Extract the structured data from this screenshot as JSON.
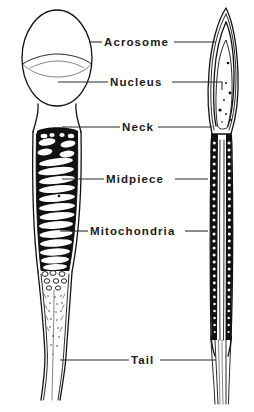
{
  "figure": {
    "background_color": "#ffffff",
    "ink_color": "#111111",
    "label_color": "#1a1a1a",
    "views": [
      {
        "name": "flat-face-view",
        "position": "left"
      },
      {
        "name": "edge-side-view",
        "position": "right"
      }
    ]
  },
  "labels": [
    {
      "id": "acrosome",
      "text": "Acrosome",
      "text_x": 104,
      "text_y": 46,
      "left_leader": {
        "x1": 90,
        "y1": 42,
        "x2": 102,
        "y2": 42
      },
      "right_leader": {
        "x1": 174,
        "y1": 42,
        "x2": 216,
        "y2": 42
      }
    },
    {
      "id": "nucleus",
      "text": "Nucleus",
      "text_x": 110,
      "text_y": 86,
      "left_leader": {
        "x1": 58,
        "y1": 82,
        "x2": 108,
        "y2": 82
      },
      "right_leader": {
        "x1": 172,
        "y1": 82,
        "x2": 218,
        "y2": 82
      }
    },
    {
      "id": "neck",
      "text": "Neck",
      "text_x": 122,
      "text_y": 131,
      "left_leader": {
        "x1": 62,
        "y1": 127,
        "x2": 120,
        "y2": 127
      },
      "right_leader": {
        "x1": 158,
        "y1": 127,
        "x2": 212,
        "y2": 127
      }
    },
    {
      "id": "midpiece",
      "text": "Midpiece",
      "text_x": 106,
      "text_y": 183,
      "left_leader": {
        "x1": 62,
        "y1": 179,
        "x2": 104,
        "y2": 179
      },
      "right_leader": {
        "x1": 175,
        "y1": 179,
        "x2": 208,
        "y2": 179
      }
    },
    {
      "id": "mitochondria",
      "text": "Mitochondria",
      "text_x": 90,
      "text_y": 235,
      "left_leader": {
        "x1": 60,
        "y1": 231,
        "x2": 88,
        "y2": 231
      },
      "right_leader": {
        "x1": 185,
        "y1": 231,
        "x2": 208,
        "y2": 231
      }
    },
    {
      "id": "tail",
      "text": "Tail",
      "text_x": 131,
      "text_y": 364,
      "left_leader": {
        "x1": 60,
        "y1": 360,
        "x2": 129,
        "y2": 360
      },
      "right_leader": {
        "x1": 160,
        "y1": 360,
        "x2": 216,
        "y2": 360
      }
    }
  ],
  "parts": {
    "left_view": {
      "head_outline": "ovoid head, acrosome cap over nucleus",
      "acrosome_cap": "upper two-thirds dome",
      "nucleus": "lower rounded portion",
      "neck": "narrow constricted junction",
      "midpiece": "helical mitochondrial sheath",
      "tail": "tapering flagellum with stippled texture"
    },
    "right_view": {
      "head_outline": "narrow pointed spear profile",
      "acrosome_cap": "nested outer layers at apex",
      "nucleus": "pale inner body with chromatin specks",
      "neck": "slim junction below head",
      "midpiece": "two granular mitochondrial bands flanking axial filament",
      "tail": "fine splayed filaments"
    }
  }
}
